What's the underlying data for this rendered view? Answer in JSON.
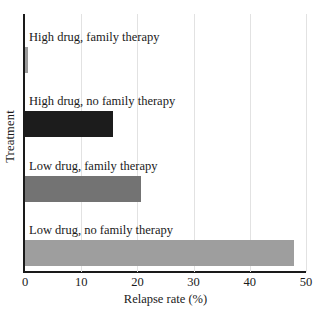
{
  "chart_data": {
    "type": "bar",
    "orientation": "horizontal",
    "title": "",
    "xlabel": "Relapse rate (%)",
    "ylabel": "Treatment",
    "xlim": [
      0,
      50
    ],
    "ylim": null,
    "grid": "vertical",
    "legend": "none",
    "xticks": [
      0,
      10,
      20,
      30,
      40,
      50
    ],
    "xtick_labels": [
      "0",
      "10",
      "20",
      "30",
      "40",
      "50"
    ],
    "categories": [
      "High drug, family therapy",
      "High drug, no family therapy",
      "Low drug, family therapy",
      "Low drug, no family therapy"
    ],
    "values": [
      0.5,
      15.7,
      20.7,
      47.9
    ],
    "bar_colors": [
      "#9a9a9a",
      "#1c1c1c",
      "#737373",
      "#9e9e9e"
    ],
    "bars": [
      {
        "label": "High drug, family therapy",
        "value": 0.5,
        "color": "#9a9a9a"
      },
      {
        "label": "High drug, no family therapy",
        "value": 15.7,
        "color": "#1c1c1c"
      },
      {
        "label": "Low drug, family therapy",
        "value": 20.7,
        "color": "#737373"
      },
      {
        "label": "Low drug, no family therapy",
        "value": 47.9,
        "color": "#9e9e9e"
      }
    ]
  },
  "axes": {
    "grid_color": "#e2e2e2",
    "axis_color": "#1a1a1a",
    "background": "#ffffff"
  }
}
